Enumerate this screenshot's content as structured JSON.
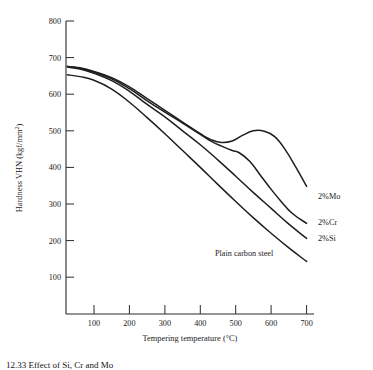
{
  "chart_data": {
    "type": "line",
    "title": "",
    "xlabel": "Tempering temperature (°C)",
    "ylabel": "Hardness VHN (kgf/mm²)",
    "ylabel_main": "Hardness VHN (kgf/mm",
    "ylabel_sup": "2",
    "ylabel_tail": ")",
    "xlim": [
      0,
      730
    ],
    "ylim": [
      40,
      830
    ],
    "grid": false,
    "legend_position": "inline-right",
    "xticks": [
      100,
      200,
      300,
      400,
      500,
      600,
      700
    ],
    "xtick_labels": [
      "100",
      "200",
      "300",
      "400",
      "500",
      "600",
      "700"
    ],
    "yticks": [
      100,
      200,
      300,
      400,
      500,
      600,
      700,
      800
    ],
    "ytick_labels": [
      "100",
      "200",
      "300",
      "400",
      "500",
      "600",
      "700",
      "800"
    ],
    "series": [
      {
        "name": "2%Mo",
        "label": "2%Mo",
        "label_x": 712,
        "label_y": 330,
        "x": [
          25,
          60,
          100,
          150,
          200,
          250,
          300,
          350,
          400,
          430,
          460,
          490,
          520,
          550,
          580,
          610,
          640,
          670,
          700
        ],
        "values": [
          676,
          672,
          662,
          645,
          620,
          588,
          556,
          524,
          492,
          476,
          468,
          472,
          488,
          500,
          499,
          484,
          448,
          400,
          348
        ]
      },
      {
        "name": "2%Cr",
        "label": "2%Cr",
        "label_x": 712,
        "label_y": 237,
        "x": [
          25,
          60,
          100,
          150,
          200,
          250,
          300,
          350,
          400,
          430,
          460,
          490,
          510,
          540,
          570,
          600,
          630,
          660,
          700
        ],
        "values": [
          676,
          671,
          660,
          642,
          615,
          582,
          551,
          521,
          490,
          472,
          458,
          446,
          440,
          416,
          378,
          340,
          305,
          274,
          247
        ]
      },
      {
        "name": "2%Si",
        "label": "2%Si",
        "label_x": 712,
        "label_y": 196,
        "x": [
          25,
          60,
          100,
          150,
          200,
          250,
          300,
          350,
          400,
          450,
          500,
          550,
          600,
          650,
          700
        ],
        "values": [
          674,
          669,
          657,
          637,
          608,
          572,
          538,
          500,
          462,
          420,
          376,
          331,
          288,
          245,
          206
        ]
      },
      {
        "name": "Plain carbon steel",
        "label": "Plain carbon steel",
        "label_x": 374,
        "label_y": 180,
        "x": [
          25,
          60,
          100,
          150,
          200,
          250,
          300,
          350,
          400,
          450,
          500,
          550,
          600,
          650,
          700
        ],
        "values": [
          653,
          648,
          638,
          614,
          578,
          536,
          492,
          446,
          400,
          353,
          307,
          262,
          220,
          180,
          143
        ]
      }
    ]
  },
  "caption": {
    "text": "12.33 Effect of Si, Cr and Mo"
  }
}
